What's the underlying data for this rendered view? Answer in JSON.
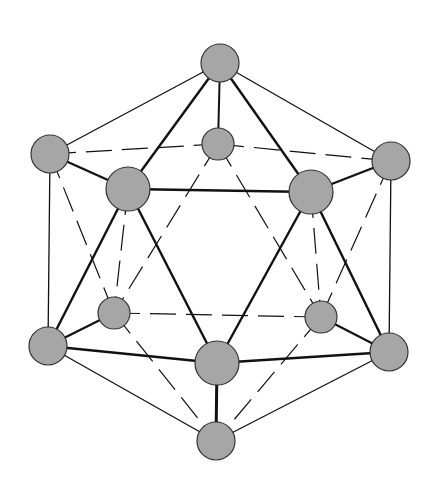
{
  "diagram": {
    "node_fill": "#a6a6a6",
    "node_stroke": "#333333",
    "edge_color": "#111111",
    "nodes": [
      {
        "id": "top",
        "x": 220,
        "y": 63,
        "r": 19
      },
      {
        "id": "back-top",
        "x": 218,
        "y": 144,
        "r": 16
      },
      {
        "id": "left-upper",
        "x": 50,
        "y": 154,
        "r": 19
      },
      {
        "id": "right-upper",
        "x": 391,
        "y": 161,
        "r": 19
      },
      {
        "id": "front-left-upper",
        "x": 128,
        "y": 189,
        "r": 22
      },
      {
        "id": "front-right-upper",
        "x": 311,
        "y": 192,
        "r": 22
      },
      {
        "id": "back-left-lower",
        "x": 114,
        "y": 313,
        "r": 16
      },
      {
        "id": "back-right-lower",
        "x": 321,
        "y": 317,
        "r": 16
      },
      {
        "id": "left-lower",
        "x": 48,
        "y": 346,
        "r": 19
      },
      {
        "id": "right-lower",
        "x": 389,
        "y": 352,
        "r": 19
      },
      {
        "id": "front-bottom",
        "x": 217,
        "y": 363,
        "r": 22
      },
      {
        "id": "bottom",
        "x": 216,
        "y": 441,
        "r": 19
      }
    ],
    "edges": [
      {
        "a": 0,
        "b": 2,
        "w": 1.3
      },
      {
        "a": 0,
        "b": 3,
        "w": 1.3
      },
      {
        "a": 0,
        "b": 1,
        "w": 2
      },
      {
        "a": 0,
        "b": 4,
        "w": 2.4
      },
      {
        "a": 0,
        "b": 5,
        "w": 2.4
      },
      {
        "a": 2,
        "b": 1,
        "w": 1.2,
        "dash": true
      },
      {
        "a": 1,
        "b": 3,
        "w": 1.2,
        "dash": true
      },
      {
        "a": 2,
        "b": 4,
        "w": 2.4
      },
      {
        "a": 5,
        "b": 3,
        "w": 2.4
      },
      {
        "a": 4,
        "b": 5,
        "w": 2.4
      },
      {
        "a": 1,
        "b": 6,
        "w": 1.2,
        "dash": true
      },
      {
        "a": 1,
        "b": 7,
        "w": 1.2,
        "dash": true
      },
      {
        "a": 2,
        "b": 8,
        "w": 1.3
      },
      {
        "a": 2,
        "b": 6,
        "w": 1.2,
        "dash": true
      },
      {
        "a": 3,
        "b": 9,
        "w": 1.3
      },
      {
        "a": 3,
        "b": 7,
        "w": 1.2,
        "dash": true
      },
      {
        "a": 4,
        "b": 8,
        "w": 2.4
      },
      {
        "a": 4,
        "b": 10,
        "w": 2.4
      },
      {
        "a": 4,
        "b": 6,
        "w": 1.2,
        "dash": true
      },
      {
        "a": 5,
        "b": 10,
        "w": 2.4
      },
      {
        "a": 5,
        "b": 9,
        "w": 2.4
      },
      {
        "a": 5,
        "b": 7,
        "w": 1.2,
        "dash": true
      },
      {
        "a": 6,
        "b": 7,
        "w": 1.2,
        "dash": true
      },
      {
        "a": 6,
        "b": 8,
        "w": 2.2
      },
      {
        "a": 7,
        "b": 9,
        "w": 2.2
      },
      {
        "a": 8,
        "b": 10,
        "w": 2.4
      },
      {
        "a": 10,
        "b": 9,
        "w": 2.4
      },
      {
        "a": 8,
        "b": 11,
        "w": 1.3
      },
      {
        "a": 9,
        "b": 11,
        "w": 1.3
      },
      {
        "a": 10,
        "b": 11,
        "w": 3
      },
      {
        "a": 6,
        "b": 11,
        "w": 1.2,
        "dash": true
      },
      {
        "a": 7,
        "b": 11,
        "w": 1.2,
        "dash": true
      }
    ]
  }
}
